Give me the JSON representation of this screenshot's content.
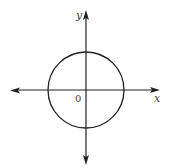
{
  "diagram": {
    "type": "coordinate-plane-with-circle",
    "labels": {
      "x_axis": "x",
      "y_axis": "y",
      "origin": "0"
    },
    "colors": {
      "background": "#ffffff",
      "stroke": "#222222",
      "label": "#444444"
    },
    "circle": {
      "center": [
        86,
        90
      ],
      "radius": 38
    },
    "axes": {
      "horizontal": {
        "from": [
          11,
          90
        ],
        "to": [
          159,
          90
        ],
        "arrows": "both"
      },
      "vertical": {
        "from": [
          86,
          11
        ],
        "to": [
          86,
          164
        ],
        "arrows": "both"
      }
    }
  }
}
